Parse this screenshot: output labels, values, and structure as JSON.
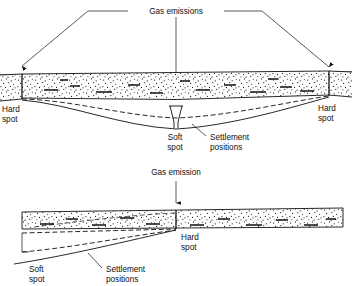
{
  "figure": {
    "type": "engineering-cross-section"
  },
  "upper_diagram": {
    "gas_label": "Gas emissions",
    "left_hard_spot": {
      "line1": "Hard",
      "line2": "spot"
    },
    "right_hard_spot": {
      "line1": "Hard",
      "line2": "spot"
    },
    "soft_spot": {
      "line1": "Soft",
      "line2": "spot"
    },
    "settlement": {
      "line1": "Settlement",
      "line2": "positions"
    }
  },
  "lower_diagram": {
    "gas_label": "Gas emission",
    "hard_spot": {
      "line1": "Hard",
      "line2": "spot"
    },
    "soft_spot": {
      "line1": "Soft",
      "line2": "spot"
    },
    "settlement": {
      "line1": "Settlement",
      "line2": "positions"
    }
  },
  "colors": {
    "ink": "#111111",
    "fill": "#ffffff",
    "caption": "#8e8e8e"
  }
}
